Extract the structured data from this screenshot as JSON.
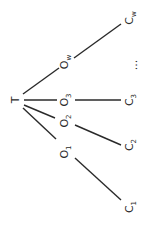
{
  "diagram": {
    "type": "tree",
    "orientation": "rotated-90-ccw",
    "root": {
      "label": "T",
      "x": 15,
      "y": 100
    },
    "intermediate_nodes": [
      {
        "label": "O",
        "sub": "w",
        "x": 66,
        "y": 62
      },
      {
        "label": "O",
        "sub": "3",
        "x": 66,
        "y": 100
      },
      {
        "label": "O",
        "sub": "2",
        "x": 66,
        "y": 121
      },
      {
        "label": "O",
        "sub": "1",
        "x": 66,
        "y": 152
      }
    ],
    "leaf_nodes": [
      {
        "label": "C",
        "sub": "w",
        "x": 131,
        "y": 18
      },
      {
        "label": "...",
        "sub": "",
        "x": 133,
        "y": 65
      },
      {
        "label": "C",
        "sub": "3",
        "x": 131,
        "y": 100
      },
      {
        "label": "C",
        "sub": "2",
        "x": 131,
        "y": 145
      },
      {
        "label": "C",
        "sub": "1",
        "x": 131,
        "y": 207
      }
    ],
    "edges": [
      {
        "from": "T",
        "to": "Ow",
        "x1": 23,
        "y1": 94,
        "x2": 59,
        "y2": 68
      },
      {
        "from": "Ow",
        "to": "Cw",
        "x1": 74,
        "y1": 58,
        "x2": 121,
        "y2": 24
      },
      {
        "from": "T",
        "to": "O3",
        "x1": 24,
        "y1": 100,
        "x2": 57,
        "y2": 100
      },
      {
        "from": "O3",
        "to": "C3",
        "x1": 75,
        "y1": 100,
        "x2": 121,
        "y2": 100
      },
      {
        "from": "T",
        "to": "O2",
        "x1": 24,
        "y1": 105,
        "x2": 55,
        "y2": 118
      },
      {
        "from": "O2",
        "to": "C2",
        "x1": 75,
        "y1": 125,
        "x2": 121,
        "y2": 145
      },
      {
        "from": "T",
        "to": "O1",
        "x1": 23,
        "y1": 108,
        "x2": 56,
        "y2": 139
      },
      {
        "from": "O1",
        "to": "C1",
        "x1": 75,
        "y1": 158,
        "x2": 121,
        "y2": 200
      }
    ],
    "line_color": "#2a2a2a",
    "text_color": "#2a2a2a"
  }
}
